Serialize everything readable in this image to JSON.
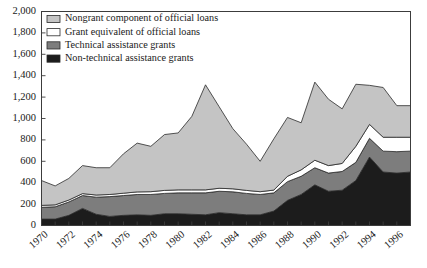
{
  "chart_data": {
    "type": "area",
    "stacked": true,
    "title": "",
    "subtitle": "",
    "xlabel": "",
    "ylabel": "",
    "xlim": [
      1970,
      1997
    ],
    "ylim": [
      0,
      2000
    ],
    "ytick_values": [
      0,
      200,
      400,
      600,
      800,
      1000,
      1200,
      1400,
      1600,
      1800,
      2000
    ],
    "ytick_labels": [
      "0",
      "200",
      "400",
      "600",
      "800",
      "1,000",
      "1,200",
      "1,400",
      "1,600",
      "1,800",
      "2,000"
    ],
    "xtick_values": [
      1970,
      1972,
      1974,
      1976,
      1978,
      1980,
      1982,
      1984,
      1986,
      1988,
      1990,
      1992,
      1994,
      1996
    ],
    "xtick_labels": [
      "1970",
      "1972",
      "1974",
      "1976",
      "1978",
      "1980",
      "1982",
      "1984",
      "1986",
      "1988",
      "1990",
      "1992",
      "1994",
      "1996"
    ],
    "x": [
      1970,
      1971,
      1972,
      1973,
      1974,
      1975,
      1976,
      1977,
      1978,
      1979,
      1980,
      1981,
      1982,
      1983,
      1984,
      1985,
      1986,
      1987,
      1988,
      1989,
      1990,
      1991,
      1992,
      1993,
      1994,
      1995,
      1996,
      1997
    ],
    "grid": false,
    "legend_position": "top-left",
    "series": [
      {
        "name": "Non-technical assistance grants",
        "color": "#1c1c1c",
        "stack_order": 1,
        "values": [
          60,
          60,
          95,
          160,
          105,
          85,
          95,
          100,
          95,
          110,
          110,
          105,
          100,
          120,
          110,
          100,
          100,
          135,
          235,
          290,
          380,
          320,
          330,
          420,
          640,
          500,
          490,
          500
        ]
      },
      {
        "name": "Technical assistance grants",
        "color": "#7d7d7d",
        "stack_order": 2,
        "values": [
          110,
          115,
          125,
          120,
          160,
          185,
          185,
          190,
          195,
          190,
          195,
          200,
          205,
          200,
          205,
          200,
          190,
          170,
          175,
          170,
          160,
          170,
          175,
          170,
          175,
          195,
          200,
          195
        ]
      },
      {
        "name": "Grant equivalent of official loans",
        "color": "#ffffff",
        "stack_order": 3,
        "values": [
          18,
          18,
          18,
          18,
          20,
          20,
          22,
          24,
          26,
          28,
          28,
          28,
          28,
          28,
          28,
          28,
          26,
          26,
          50,
          60,
          70,
          70,
          75,
          150,
          130,
          130,
          135,
          130
        ]
      },
      {
        "name": "Nongrant component of official loans",
        "color": "#c4c4c4",
        "stack_order": 4,
        "values": [
          232,
          177,
          202,
          262,
          255,
          250,
          368,
          456,
          424,
          522,
          532,
          687,
          982,
          762,
          562,
          432,
          284,
          479,
          550,
          440,
          730,
          620,
          510,
          580,
          365,
          465,
          295,
          295
        ]
      }
    ],
    "totals": [
      420,
      370,
      440,
      560,
      540,
      540,
      670,
      770,
      740,
      850,
      865,
      1020,
      1315,
      1110,
      905,
      760,
      600,
      810,
      1010,
      960,
      1340,
      1180,
      1090,
      1320,
      1310,
      1290,
      1120,
      1120
    ]
  },
  "legend": {
    "items": [
      {
        "label": "Nongrant component of official loans",
        "swatch": "#c4c4c4"
      },
      {
        "label": "Grant equivalent of official loans",
        "swatch": "#ffffff"
      },
      {
        "label": "Technical assistance grants",
        "swatch": "#7d7d7d"
      },
      {
        "label": "Non-technical assistance grants",
        "swatch": "#1c1c1c"
      }
    ]
  }
}
